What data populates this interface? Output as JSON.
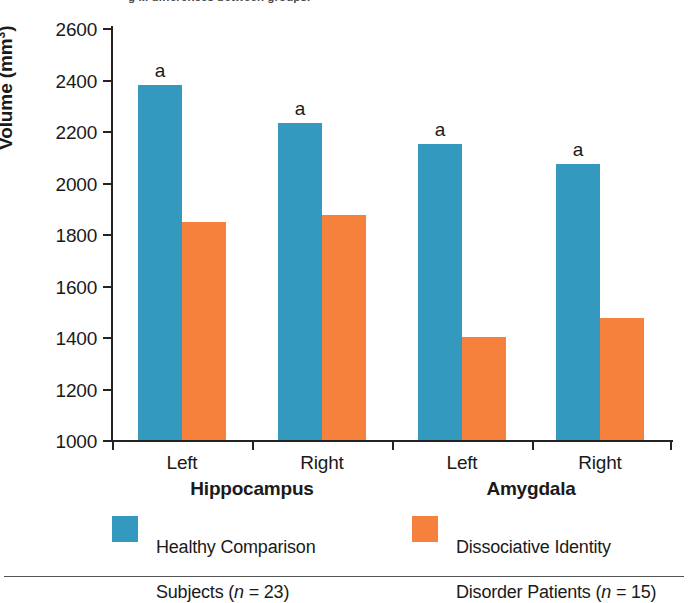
{
  "caption_sliver": "g ... differences between groups.",
  "chart_data": {
    "type": "bar",
    "title": "",
    "xlabel": "",
    "ylabel": "Volume (mm³)",
    "ylabel_main": "Volume (mm",
    "ylabel_sup": "3",
    "ylabel_tail": ")",
    "ylim": [
      1000,
      2600
    ],
    "ytick_step": 200,
    "yticks": [
      2600,
      2400,
      2200,
      2000,
      1800,
      1600,
      1400,
      1200,
      1000
    ],
    "ytick_labels": [
      "2600",
      "2400",
      "2200",
      "2000",
      "1800",
      "1600",
      "1400",
      "1200",
      "1000"
    ],
    "grid": false,
    "legend_position": "bottom",
    "categories": [
      "Left",
      "Right",
      "Left",
      "Right"
    ],
    "groups": [
      {
        "name": "Hippocampus",
        "categories": [
          "Left",
          "Right"
        ]
      },
      {
        "name": "Amygdala",
        "categories": [
          "Left",
          "Right"
        ]
      }
    ],
    "series": [
      {
        "name": "Healthy Comparison Subjects (n = 23)",
        "color": "#3399bf",
        "values": [
          2380,
          2230,
          2150,
          2070
        ]
      },
      {
        "name": "Dissociative Identity Disorder Patients (n = 15)",
        "color": "#f5813c",
        "values": [
          1845,
          1875,
          1400,
          1475
        ]
      }
    ],
    "annotations": [
      {
        "text": "a",
        "series": 0,
        "category_index": 0
      },
      {
        "text": "a",
        "series": 0,
        "category_index": 1
      },
      {
        "text": "a",
        "series": 0,
        "category_index": 2
      },
      {
        "text": "a",
        "series": 0,
        "category_index": 3
      }
    ]
  },
  "legend": {
    "entries": [
      {
        "color": "#3399bf",
        "line1": "Healthy Comparison",
        "line2_pre": "Subjects (",
        "line2_italic": "n",
        "line2_post": " = 23)"
      },
      {
        "color": "#f5813c",
        "line1": "Dissociative Identity",
        "line2_pre": "Disorder Patients (",
        "line2_italic": "n",
        "line2_post": " = 15)"
      }
    ]
  },
  "axis_labels": {
    "cat0": "Left",
    "cat1": "Right",
    "cat2": "Left",
    "cat3": "Right",
    "group0": "Hippocampus",
    "group1": "Amygdala"
  },
  "marks": {
    "a": "a"
  }
}
